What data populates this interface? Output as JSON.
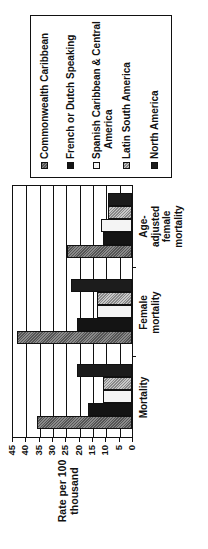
{
  "chart_data": {
    "type": "bar",
    "orientation": "vertical bars, image rotated 90 degrees counter-clockwise",
    "title": "",
    "xlabel": "",
    "ylabel": "Rate per 100 thousand",
    "ylim": [
      0,
      45
    ],
    "yticks": [
      0,
      5,
      10,
      15,
      20,
      25,
      30,
      35,
      40,
      45
    ],
    "grid": true,
    "legend_position": "right",
    "categories": [
      "Mortality",
      "Female mortality",
      "Age-adjusted female mortality"
    ],
    "series": [
      {
        "name": "Commonwealth Caribbean",
        "values": [
          35.5,
          43,
          24.5
        ]
      },
      {
        "name": "French or Dutch Speaking",
        "values": [
          16.5,
          20.5,
          11
        ]
      },
      {
        "name": "Spanish Caribbean & Central America",
        "values": [
          11,
          13,
          11.5
        ]
      },
      {
        "name": "Latin South America",
        "values": [
          11,
          13,
          9
        ]
      },
      {
        "name": "North America",
        "values": [
          20.5,
          23,
          9
        ]
      }
    ]
  },
  "labels": {
    "ylabel_line1": "Rate per 100",
    "ylabel_line2": "thousand",
    "ticks": [
      "0",
      "5",
      "10",
      "15",
      "20",
      "25",
      "30",
      "35",
      "40",
      "45"
    ],
    "categories": [
      {
        "lines": [
          "Mortality"
        ]
      },
      {
        "lines": [
          "Female",
          "mortality"
        ]
      },
      {
        "lines": [
          "Age-",
          "adjusted",
          "female",
          "mortality"
        ]
      }
    ],
    "legend": [
      {
        "lines": [
          "Commonwealth Caribbean"
        ]
      },
      {
        "lines": [
          "French or Dutch Speaking"
        ]
      },
      {
        "lines": [
          "Spanish Caribbean & Central",
          "America"
        ]
      },
      {
        "lines": [
          "Latin South America"
        ]
      },
      {
        "lines": [
          "North America"
        ]
      }
    ]
  }
}
